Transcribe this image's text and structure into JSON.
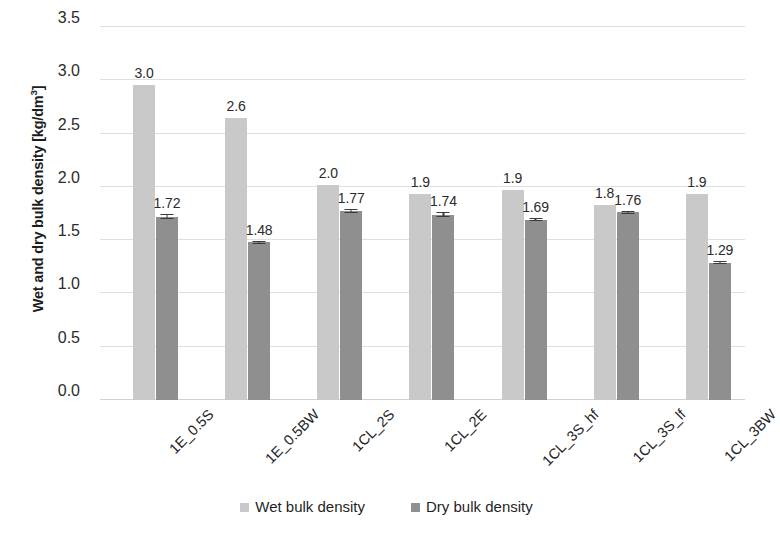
{
  "chart_data": {
    "type": "bar",
    "title": "",
    "xlabel": "",
    "ylabel": "Wet and dry bulk density [kg/dm3]",
    "ylabel_main": "Wet and dry bulk density [kg/dm",
    "ylabel_sup": "3",
    "ylabel_tail": "]",
    "ylim": [
      0.0,
      3.5
    ],
    "ytick_step": 0.5,
    "grid": true,
    "legend_position": "bottom",
    "categories": [
      "1E_0.5S",
      "1E_0.5BW",
      "1CL_2S",
      "1CL_2E",
      "1CL_3S_hf",
      "1CL_3S_lf",
      "1CL_3BW"
    ],
    "yticks": [
      "0.0",
      "0.5",
      "1.0",
      "1.5",
      "2.0",
      "2.5",
      "3.0",
      "3.5"
    ],
    "ytick_values": [
      0.0,
      0.5,
      1.0,
      1.5,
      2.0,
      2.5,
      3.0,
      3.5
    ],
    "series": [
      {
        "name": "Wet bulk density",
        "color": "#c9c9c9",
        "values": [
          2.96,
          2.65,
          2.02,
          1.93,
          1.97,
          1.83,
          1.93
        ],
        "labels": [
          "3.0",
          "2.6",
          "2.0",
          "1.9",
          "1.9",
          "1.8",
          "1.9"
        ],
        "errors": [
          0,
          0,
          0,
          0,
          0,
          0,
          0
        ]
      },
      {
        "name": "Dry bulk density",
        "color": "#8f8f8f",
        "values": [
          1.72,
          1.48,
          1.77,
          1.74,
          1.69,
          1.76,
          1.29
        ],
        "labels": [
          "1.72",
          "1.48",
          "1.77",
          "1.74",
          "1.69",
          "1.76",
          "1.29"
        ],
        "errors": [
          0.025,
          0.015,
          0.018,
          0.022,
          0.014,
          0.016,
          0.015
        ]
      }
    ]
  },
  "legend": {
    "items": [
      {
        "label": "Wet bulk density",
        "color": "#c9c9c9"
      },
      {
        "label": "Dry bulk density",
        "color": "#8f8f8f"
      }
    ]
  }
}
